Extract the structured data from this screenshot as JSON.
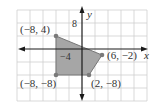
{
  "figure": {
    "type": "coordinate-plane-polygon",
    "axes": {
      "x_label": "x",
      "y_label": "y",
      "grid_step_units": 4
    },
    "tick_labels": [
      {
        "text": "8",
        "axis": "y",
        "value": 8
      },
      {
        "text": "−4",
        "axis": "x",
        "value": -4
      }
    ],
    "vertices": [
      {
        "x": -8,
        "y": 4,
        "label": "(−8, 4)"
      },
      {
        "x": 6,
        "y": -2,
        "label": "(6, −2)"
      },
      {
        "x": 2,
        "y": -8,
        "label": "(2, −8)"
      },
      {
        "x": -8,
        "y": -8,
        "label": "(−8, −8)"
      }
    ],
    "colors": {
      "fill": "#a6a6a6",
      "vertex": "#7a7a7a",
      "grid": "#cfcfcf",
      "axis": "#1a1a1a"
    }
  },
  "labels": {
    "v1": "(−8, 4)",
    "v2": "(6, −2)",
    "v3": "(2, −8)",
    "v4": "(−8, −8)",
    "x_axis": "x",
    "y_axis": "y",
    "tick_y8": "8",
    "tick_xm4": "−4"
  }
}
